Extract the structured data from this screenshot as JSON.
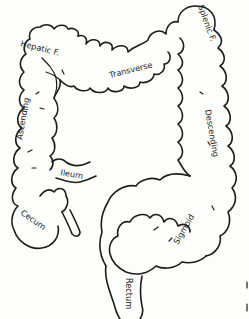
{
  "diagram": {
    "labels": {
      "hepatic": "Hepatic F.",
      "transverse": "Transverse",
      "splenic": "Splenic F.",
      "ascending": "Ascending",
      "descending": "Descending",
      "ileum": "Ileum",
      "cecum": "Cecum",
      "sigmoid": "Sigmoid",
      "rectum": "Rectum"
    },
    "colors": {
      "line": "#1c1c1c",
      "background": "#fdfdfb"
    }
  }
}
